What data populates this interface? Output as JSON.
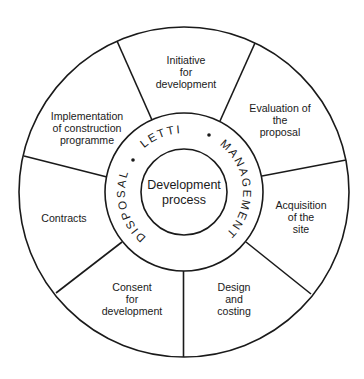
{
  "diagram": {
    "type": "circular-process-wheel",
    "center": {
      "line1": "Development",
      "line2": "process"
    },
    "ring": {
      "labels": [
        "DISPOSAL",
        "LETTING",
        "MANAGEMENT"
      ],
      "separator": "•"
    },
    "segments": [
      {
        "id": "initiative",
        "lines": [
          "Initiative",
          "for",
          "development"
        ]
      },
      {
        "id": "evaluation",
        "lines": [
          "Evaluation of",
          "the",
          "proposal"
        ]
      },
      {
        "id": "acquisition",
        "lines": [
          "Acquisition",
          "of the",
          "site"
        ]
      },
      {
        "id": "design",
        "lines": [
          "Design",
          "and",
          "costing"
        ]
      },
      {
        "id": "consent",
        "lines": [
          "Consent",
          "for",
          "development"
        ]
      },
      {
        "id": "contracts",
        "lines": [
          "Contracts"
        ]
      },
      {
        "id": "implementation",
        "lines": [
          "Implementation",
          "of construction",
          "programme"
        ]
      }
    ],
    "colors": {
      "stroke": "#1a1a1a",
      "background": "#ffffff"
    }
  }
}
